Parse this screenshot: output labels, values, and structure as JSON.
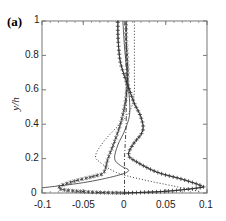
{
  "figure": {
    "panel_label": "(a)",
    "ylabel": "y/h"
  },
  "axes": {
    "x_ticks": [
      "-0.1",
      "-0.05",
      "0",
      "0.05",
      "0.1"
    ],
    "y_ticks": [
      "0",
      "0.2",
      "0.4",
      "0.6",
      "0.8",
      "1"
    ]
  },
  "chart_data": {
    "type": "line",
    "title": "(a)",
    "xlabel": "",
    "ylabel": "y/h",
    "xlim": [
      -0.1,
      0.1
    ],
    "ylim": [
      0,
      1
    ],
    "grid": false,
    "legend": null,
    "x_ticks": [
      -0.1,
      -0.05,
      0,
      0.05,
      0.1
    ],
    "y_ticks": [
      0,
      0.2,
      0.4,
      0.6,
      0.8,
      1
    ],
    "series": [
      {
        "name": "plus-marker curve (solid with + markers)",
        "style": "solid-plus",
        "points": [
          [
            0,
            0
          ],
          [
            0.05,
            0.01
          ],
          [
            0.09,
            0.03
          ],
          [
            0.094,
            0.04
          ],
          [
            0.07,
            0.08
          ],
          [
            0.04,
            0.12
          ],
          [
            0.015,
            0.18
          ],
          [
            0.005,
            0.22
          ],
          [
            0.01,
            0.28
          ],
          [
            0.022,
            0.36
          ],
          [
            0.02,
            0.44
          ],
          [
            0.012,
            0.52
          ],
          [
            0.006,
            0.6
          ],
          [
            0.0,
            0.68
          ],
          [
            -0.005,
            0.76
          ],
          [
            -0.007,
            0.84
          ],
          [
            -0.008,
            0.92
          ],
          [
            -0.008,
            1.0
          ]
        ]
      },
      {
        "name": "star-marker curve (dashed with * markers)",
        "style": "dashed-star",
        "points": [
          [
            0,
            0
          ],
          [
            -0.04,
            0.005
          ],
          [
            -0.075,
            0.02
          ],
          [
            -0.078,
            0.04
          ],
          [
            -0.06,
            0.07
          ],
          [
            -0.035,
            0.1
          ],
          [
            -0.025,
            0.12
          ],
          [
            -0.02,
            0.2
          ],
          [
            -0.012,
            0.3
          ],
          [
            -0.005,
            0.4
          ],
          [
            0.0,
            0.5
          ],
          [
            0.003,
            0.6
          ],
          [
            0.004,
            0.7
          ],
          [
            0.003,
            0.8
          ],
          [
            0.002,
            0.9
          ],
          [
            0.002,
            1.0
          ]
        ]
      },
      {
        "name": "dotted curve",
        "style": "dotted",
        "points": [
          [
            0.09,
            0.01
          ],
          [
            0.06,
            0.04
          ],
          [
            0.02,
            0.08
          ],
          [
            -0.01,
            0.12
          ],
          [
            -0.03,
            0.18
          ],
          [
            -0.035,
            0.22
          ],
          [
            -0.025,
            0.3
          ],
          [
            -0.01,
            0.38
          ],
          [
            0.003,
            0.45
          ],
          [
            0.01,
            0.52
          ],
          [
            0.012,
            0.6
          ],
          [
            0.012,
            0.7
          ],
          [
            0.012,
            0.8
          ],
          [
            0.012,
            0.9
          ],
          [
            0.012,
            1.0
          ]
        ]
      },
      {
        "name": "solid thin curve",
        "style": "solid",
        "points": [
          [
            -0.1,
            0.03
          ],
          [
            -0.05,
            0.06
          ],
          [
            -0.01,
            0.1
          ],
          [
            0.005,
            0.13
          ],
          [
            -0.005,
            0.16
          ],
          [
            -0.012,
            0.2
          ],
          [
            -0.008,
            0.28
          ],
          [
            0.0,
            0.36
          ],
          [
            0.006,
            0.45
          ],
          [
            0.006,
            0.55
          ],
          [
            0.004,
            0.65
          ],
          [
            0.002,
            0.75
          ],
          [
            0.0,
            0.85
          ],
          [
            -0.002,
            1.0
          ]
        ]
      },
      {
        "name": "dash-dot curve",
        "style": "dashdot",
        "points": [
          [
            0.0,
            0.0
          ],
          [
            0.0,
            0.1
          ],
          [
            0.0,
            0.2
          ],
          [
            0.001,
            0.3
          ],
          [
            0.002,
            0.4
          ],
          [
            0.002,
            0.5
          ],
          [
            0.002,
            0.6
          ],
          [
            0.002,
            0.7
          ],
          [
            0.002,
            0.8
          ],
          [
            0.002,
            0.9
          ],
          [
            0.002,
            1.0
          ]
        ]
      }
    ]
  }
}
